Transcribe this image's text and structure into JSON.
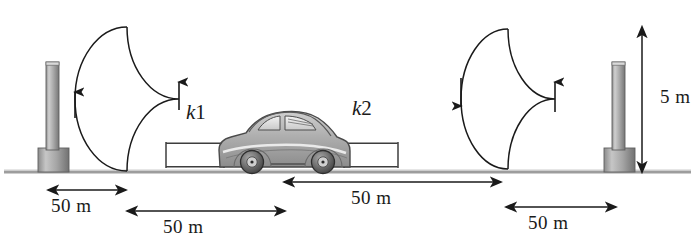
{
  "figure": {
    "ground_line": {
      "y": 172,
      "x_start": 4,
      "x_end": 691
    },
    "colors": {
      "ink": "#1a1a1a",
      "post_fill": "#9a9a9a",
      "post_light": "#c8c8c8",
      "post_dark": "#6f6f6f",
      "spring": "#3a3a3a",
      "car_body": "#b5b5b5",
      "car_dark": "#545454",
      "background": "#ffffff"
    }
  },
  "posts": [
    {
      "name": "left-post",
      "x": 38,
      "shaft_top": 62,
      "base_top": 148
    },
    {
      "name": "right-post",
      "x": 604,
      "shaft_top": 62,
      "base_top": 148
    }
  ],
  "loops": [
    {
      "name": "left-loop",
      "cx": 127,
      "cy": 99,
      "rx": 52,
      "ry": 72,
      "left_arrow": "up",
      "right_arrow": "up"
    },
    {
      "name": "right-loop",
      "cx": 508,
      "cy": 99,
      "rx": 47,
      "ry": 70,
      "left_arrow": "down",
      "right_arrow": "up"
    }
  ],
  "springs": [
    {
      "name": "spring-k1",
      "label": "k1",
      "x_start": 166,
      "x_end": 224,
      "y": 155,
      "coils": 22
    },
    {
      "name": "spring-k2",
      "label": "k2",
      "x_start": 344,
      "x_end": 398,
      "y": 155,
      "coils": 20
    }
  ],
  "spring_labels": [
    {
      "name": "spring-label-k1",
      "letter": "k",
      "subscript": "1",
      "x": 186,
      "y": 100
    },
    {
      "name": "spring-label-k2",
      "letter": "k",
      "subscript": "2",
      "x": 352,
      "y": 96
    }
  ],
  "car": {
    "name": "car",
    "x": 216,
    "y": 106,
    "width": 132,
    "height": 66,
    "description": "vintage sedan, side view, facing right"
  },
  "dimensions": [
    {
      "name": "dimension-left-post-to-loop",
      "label": "50 m",
      "orientation": "horizontal",
      "x_start": 48,
      "x_end": 126,
      "y": 190,
      "label_x": 51,
      "label_y": 198
    },
    {
      "name": "dimension-loop-to-car",
      "label": "50 m",
      "orientation": "horizontal",
      "x_start": 127,
      "x_end": 285,
      "y": 211,
      "label_x": 163,
      "label_y": 219
    },
    {
      "name": "dimension-car-to-right-loop",
      "label": "50 m",
      "orientation": "horizontal",
      "x_start": 284,
      "x_end": 501,
      "y": 182,
      "label_x": 351,
      "label_y": 190
    },
    {
      "name": "dimension-right-loop-to-post",
      "label": "50 m",
      "orientation": "horizontal",
      "x_start": 506,
      "x_end": 616,
      "y": 207,
      "label_x": 528,
      "label_y": 215
    },
    {
      "name": "dimension-post-height",
      "label": "5 m",
      "orientation": "vertical",
      "x": 642,
      "y_start": 27,
      "y_end": 172,
      "label_x": 660,
      "label_y": 88
    }
  ]
}
